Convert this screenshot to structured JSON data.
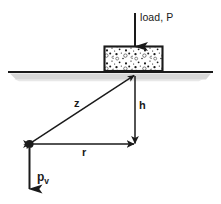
{
  "figure": {
    "type": "engineering-diagram",
    "width": 221,
    "height": 204,
    "background_color": "#ffffff",
    "ink_color": "#1a1a1a",
    "shadow_color": "#c8c8c8",
    "labels": {
      "load": "load, P",
      "z": "z",
      "h": "h",
      "r": "r",
      "pv_base": "p",
      "pv_sub": "v"
    },
    "elements": {
      "ground_line": {
        "x1": 8,
        "y1": 72,
        "x2": 213,
        "y2": 72
      },
      "footing_block": {
        "x": 104,
        "y": 46,
        "width": 59,
        "height": 25,
        "fill": "speckled-concrete"
      },
      "load_arrow": {
        "x": 135,
        "y_start": 13,
        "y_end": 47,
        "direction": "down"
      },
      "apex_point": {
        "x": 135,
        "y": 75
      },
      "stress_point": {
        "x": 29,
        "y": 144
      },
      "h_line": {
        "x": 135,
        "y1": 76,
        "y2": 144,
        "direction": "down"
      },
      "r_line": {
        "x1": 29,
        "y1": 144,
        "x2": 135,
        "y2": 144,
        "direction": "both"
      },
      "z_line": {
        "x1": 29,
        "y1": 144,
        "x2": 135,
        "y2": 75,
        "direction": "both"
      },
      "pv_arrow": {
        "x": 29,
        "y_start": 148,
        "y_end": 190,
        "direction": "down"
      }
    }
  }
}
